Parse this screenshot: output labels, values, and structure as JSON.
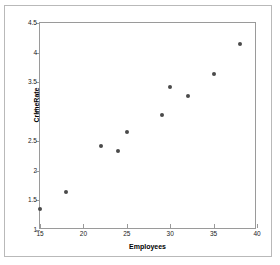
{
  "chart_data": {
    "type": "scatter",
    "title": "",
    "xlabel": "Employees",
    "ylabel": "CrimeRate",
    "xlim": [
      15,
      40
    ],
    "ylim": [
      1,
      4.5
    ],
    "xticks": [
      "15",
      "20",
      "25",
      "30",
      "35",
      "40"
    ],
    "xtick_values": [
      15,
      20,
      25,
      30,
      35,
      40
    ],
    "yticks": [
      "1",
      "1.5",
      "2",
      "2.5",
      "3",
      "3.5",
      "4",
      "4.5"
    ],
    "ytick_values": [
      1,
      1.5,
      2,
      2.5,
      3,
      3.5,
      4,
      4.5
    ],
    "grid": false,
    "legend": null,
    "marker_color": "#4a4a4a",
    "axis_color": "#9a9a9a",
    "points": [
      {
        "x": 15,
        "y": 1.36
      },
      {
        "x": 18,
        "y": 1.64
      },
      {
        "x": 22,
        "y": 2.42
      },
      {
        "x": 24,
        "y": 2.34
      },
      {
        "x": 25,
        "y": 2.65
      },
      {
        "x": 29,
        "y": 2.95
      },
      {
        "x": 30,
        "y": 3.42
      },
      {
        "x": 32,
        "y": 3.27
      },
      {
        "x": 35,
        "y": 3.64
      },
      {
        "x": 38,
        "y": 4.15
      }
    ]
  }
}
